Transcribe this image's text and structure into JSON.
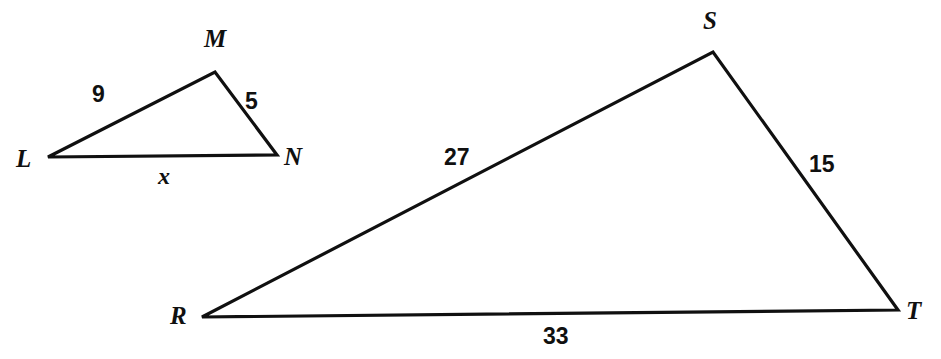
{
  "figure": {
    "background_color": "#ffffff",
    "stroke_color": "#101010",
    "stroke_width": 3.2,
    "width": 941,
    "height": 359
  },
  "triangles": [
    {
      "name": "triangle-lmn",
      "vertices": [
        {
          "label": "L",
          "x": 48,
          "y": 157,
          "label_x": 16,
          "label_y": 146
        },
        {
          "label": "M",
          "x": 215,
          "y": 72,
          "label_x": 204,
          "label_y": 26
        },
        {
          "label": "N",
          "x": 277,
          "y": 155,
          "label_x": 284,
          "label_y": 144
        }
      ],
      "sides": [
        {
          "name": "side-lm",
          "from": "L",
          "to": "M",
          "length_label": "9",
          "label_x": 92,
          "label_y": 83
        },
        {
          "name": "side-mn",
          "from": "M",
          "to": "N",
          "length_label": "5",
          "label_x": 245,
          "label_y": 90
        },
        {
          "name": "side-ln",
          "from": "L",
          "to": "N",
          "length_label": "x",
          "label_x": 158,
          "label_y": 164,
          "is_variable": true
        }
      ]
    },
    {
      "name": "triangle-rst",
      "vertices": [
        {
          "label": "R",
          "x": 202,
          "y": 317,
          "label_x": 170,
          "label_y": 303
        },
        {
          "label": "S",
          "x": 713,
          "y": 52,
          "label_x": 703,
          "label_y": 8
        },
        {
          "label": "T",
          "x": 898,
          "y": 310,
          "label_x": 906,
          "label_y": 298
        }
      ],
      "sides": [
        {
          "name": "side-rs",
          "from": "R",
          "to": "S",
          "length_label": "27",
          "label_x": 444,
          "label_y": 146
        },
        {
          "name": "side-st",
          "from": "S",
          "to": "T",
          "length_label": "15",
          "label_x": 809,
          "label_y": 153
        },
        {
          "name": "side-rt",
          "from": "R",
          "to": "T",
          "length_label": "33",
          "label_x": 543,
          "label_y": 325
        }
      ]
    }
  ]
}
